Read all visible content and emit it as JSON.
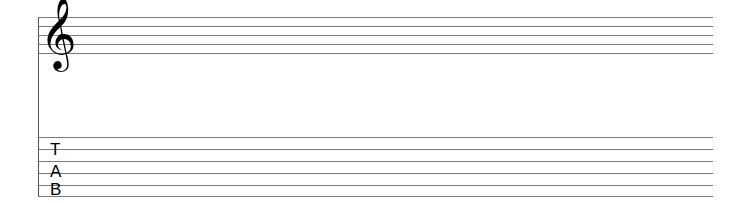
{
  "staff": {
    "clef_symbol": "𝄞",
    "clef_name": "treble",
    "line_count": 5
  },
  "tab_staff": {
    "letters": [
      "T",
      "A",
      "B"
    ],
    "line_count": 6
  },
  "colors": {
    "line": "#7a7a7a",
    "ink": "#000000",
    "background": "#ffffff"
  }
}
